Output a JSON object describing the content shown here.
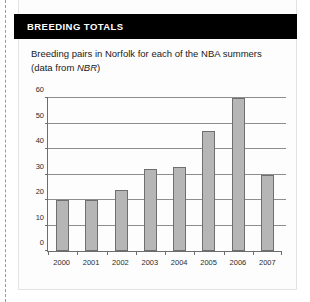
{
  "perforation": {
    "name": "tear-off-dashed-line"
  },
  "card": {
    "title": "BREEDING TOTALS",
    "subtitle_line1": "Breeding pairs in Norfolk for each of the NBA summers",
    "subtitle_line2_prefix": "(data from ",
    "subtitle_line2_italic": "NBR",
    "subtitle_line2_suffix": ")"
  },
  "colors": {
    "header_background": "#000000",
    "header_text": "#ffffff",
    "bar_fill": "#b6b6b6",
    "bar_stroke": "#6f6f6f",
    "gridline": "#8d8d8d",
    "axis": "#6d6d6d",
    "card_background": "#fdfdfd"
  },
  "chart_data": {
    "type": "bar",
    "title": "Breeding pairs in Norfolk for each of the NBA summers",
    "xlabel": "",
    "ylabel": "",
    "categories": [
      "2000",
      "2001",
      "2002",
      "2003",
      "2004",
      "2005",
      "2006",
      "2007"
    ],
    "values": [
      20,
      20,
      24,
      32,
      33,
      47,
      60,
      30
    ],
    "ylim": [
      0,
      60
    ],
    "yticks": [
      0,
      10,
      20,
      30,
      40,
      50,
      60
    ],
    "ytick_labels": [
      "0",
      "10",
      "20",
      "30",
      "40",
      "50",
      "60"
    ],
    "grid": true,
    "legend": false,
    "legend_position": "none"
  }
}
